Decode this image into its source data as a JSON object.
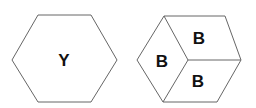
{
  "figure": {
    "left_shape": {
      "type": "hexagon",
      "label": "Y"
    },
    "right_shape": {
      "type": "hexagon-divided-cube",
      "faces": [
        {
          "position": "top",
          "label": "B"
        },
        {
          "position": "left",
          "label": "B"
        },
        {
          "position": "bottom-right",
          "label": "B"
        }
      ]
    },
    "stroke_color": "#666666",
    "text_color": "#111111"
  }
}
